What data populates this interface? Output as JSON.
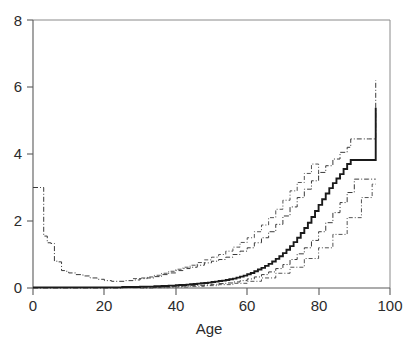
{
  "chart_data": {
    "type": "line",
    "title": "",
    "subtitle": "",
    "xlabel": "Age",
    "ylabel": "",
    "xlim": [
      0,
      100
    ],
    "ylim": [
      0,
      8
    ],
    "grid": false,
    "legend": null,
    "xticks": [
      0,
      20,
      40,
      60,
      80,
      100
    ],
    "yticks": [
      0,
      2,
      4,
      6,
      8
    ],
    "xtick_labels": [
      "0",
      "20",
      "40",
      "60",
      "80",
      "100"
    ],
    "ytick_labels": [
      "0",
      "2",
      "4",
      "6",
      "8"
    ],
    "style": "step",
    "annotations": [],
    "series": [
      {
        "name": "estimate",
        "style": "solid",
        "color": "#1a1a1a",
        "x": [
          0,
          1,
          2,
          3,
          4,
          5,
          6,
          8,
          10,
          12,
          15,
          18,
          20,
          22,
          25,
          28,
          30,
          32,
          34,
          35,
          36,
          37,
          38,
          39,
          40,
          41,
          42,
          43,
          44,
          45,
          46,
          47,
          48,
          49,
          50,
          51,
          52,
          53,
          54,
          55,
          56,
          57,
          58,
          59,
          60,
          61,
          62,
          63,
          64,
          65,
          66,
          67,
          68,
          69,
          70,
          71,
          72,
          73,
          74,
          75,
          76,
          77,
          78,
          79,
          80,
          81,
          82,
          83,
          84,
          85,
          86,
          87,
          88,
          89,
          90,
          91,
          92,
          93,
          94,
          95,
          96
        ],
        "y": [
          0.02,
          0.02,
          0.02,
          0.02,
          0.02,
          0.02,
          0.02,
          0.02,
          0.02,
          0.02,
          0.02,
          0.02,
          0.02,
          0.02,
          0.03,
          0.03,
          0.04,
          0.04,
          0.05,
          0.05,
          0.06,
          0.06,
          0.07,
          0.07,
          0.08,
          0.09,
          0.09,
          0.1,
          0.11,
          0.12,
          0.13,
          0.14,
          0.15,
          0.16,
          0.18,
          0.19,
          0.21,
          0.22,
          0.24,
          0.26,
          0.28,
          0.31,
          0.34,
          0.37,
          0.41,
          0.45,
          0.5,
          0.55,
          0.6,
          0.66,
          0.72,
          0.79,
          0.87,
          0.95,
          1.04,
          1.14,
          1.25,
          1.37,
          1.5,
          1.64,
          1.79,
          1.95,
          2.12,
          2.3,
          2.48,
          2.65,
          2.82,
          2.98,
          3.13,
          3.27,
          3.4,
          3.55,
          3.7,
          3.82,
          3.82,
          3.82,
          3.82,
          3.82,
          3.82,
          3.82,
          5.38
        ]
      },
      {
        "name": "inner-upper",
        "style": "dashdot",
        "color": "#3a3a3a",
        "x": [
          0,
          2,
          3,
          3,
          4,
          5,
          6,
          7,
          8,
          9,
          10,
          12,
          14,
          16,
          18,
          20,
          22,
          24,
          26,
          28,
          30,
          32,
          34,
          36,
          38,
          40,
          42,
          44,
          46,
          48,
          50,
          52,
          54,
          56,
          58,
          60,
          62,
          64,
          66,
          68,
          70,
          72,
          74,
          76,
          78,
          80,
          82,
          84,
          86,
          88,
          89,
          90,
          92,
          94,
          95,
          96
        ],
        "y": [
          3.0,
          3.0,
          3.0,
          1.55,
          1.35,
          1.33,
          0.8,
          0.78,
          0.52,
          0.5,
          0.45,
          0.4,
          0.36,
          0.3,
          0.26,
          0.22,
          0.2,
          0.2,
          0.22,
          0.24,
          0.28,
          0.3,
          0.34,
          0.4,
          0.45,
          0.52,
          0.58,
          0.62,
          0.68,
          0.75,
          0.8,
          0.85,
          0.92,
          1.0,
          1.1,
          1.2,
          1.35,
          1.5,
          1.68,
          1.9,
          2.15,
          2.42,
          2.7,
          2.95,
          3.2,
          3.45,
          3.65,
          3.85,
          4.05,
          4.2,
          4.45,
          4.45,
          4.45,
          4.45,
          4.45,
          6.2
        ]
      },
      {
        "name": "inner-lower",
        "style": "dashdot",
        "color": "#3a3a3a",
        "x": [
          0,
          5,
          10,
          15,
          20,
          25,
          30,
          34,
          36,
          38,
          40,
          42,
          44,
          46,
          48,
          50,
          52,
          54,
          56,
          58,
          60,
          62,
          64,
          66,
          68,
          70,
          72,
          74,
          76,
          78,
          80,
          82,
          84,
          86,
          88,
          90,
          92,
          94,
          95,
          96
        ],
        "y": [
          0.0,
          0.0,
          0.0,
          0.0,
          0.0,
          0.01,
          0.01,
          0.02,
          0.03,
          0.04,
          0.05,
          0.06,
          0.07,
          0.08,
          0.09,
          0.11,
          0.13,
          0.15,
          0.18,
          0.22,
          0.27,
          0.33,
          0.4,
          0.48,
          0.58,
          0.7,
          0.85,
          1.02,
          1.2,
          1.42,
          1.68,
          1.95,
          2.25,
          2.55,
          2.85,
          3.25,
          3.25,
          3.25,
          3.25,
          3.25
        ]
      },
      {
        "name": "outer-upper",
        "style": "dashdot",
        "color": "#4a4a4a",
        "x": [
          28,
          30,
          32,
          34,
          36,
          38,
          40,
          42,
          44,
          46,
          48,
          50,
          52,
          54,
          56,
          58,
          60,
          62,
          64,
          66,
          68,
          70,
          72,
          74,
          76,
          78,
          80
        ],
        "y": [
          0.28,
          0.3,
          0.33,
          0.38,
          0.44,
          0.5,
          0.56,
          0.62,
          0.68,
          0.76,
          0.84,
          0.92,
          1.0,
          1.1,
          1.22,
          1.36,
          1.5,
          1.68,
          1.88,
          2.1,
          2.35,
          2.62,
          2.9,
          3.15,
          3.42,
          3.7,
          3.25
        ]
      },
      {
        "name": "outer-lower",
        "style": "dashdot",
        "color": "#4a4a4a",
        "x": [
          30,
          34,
          38,
          40,
          44,
          48,
          52,
          56,
          60,
          64,
          68,
          72,
          76,
          80,
          84,
          88,
          92,
          95,
          96
        ],
        "y": [
          0.0,
          0.01,
          0.02,
          0.03,
          0.05,
          0.07,
          0.1,
          0.14,
          0.2,
          0.3,
          0.44,
          0.62,
          0.88,
          1.2,
          1.6,
          2.1,
          2.7,
          3.1,
          3.1
        ]
      }
    ]
  },
  "axes": {
    "x_title": "Age",
    "x_ticks": [
      "0",
      "20",
      "40",
      "60",
      "80",
      "100"
    ],
    "y_ticks": [
      "0",
      "2",
      "4",
      "6",
      "8"
    ]
  },
  "colors": {
    "background": "#ffffff",
    "frame": "#8a8a8a",
    "axis": "#5a5a5a",
    "estimate": "#1a1a1a",
    "band": "#3a3a3a",
    "text": "#2b2b2b"
  }
}
